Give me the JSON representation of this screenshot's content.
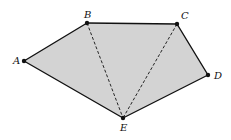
{
  "diagram": {
    "type": "pentagon",
    "fill_color": "#d3d3d3",
    "stroke_color": "#111111",
    "vertices": [
      {
        "id": "A",
        "label": "A",
        "x": 24,
        "y": 61,
        "lx": 13,
        "ly": 64
      },
      {
        "id": "B",
        "label": "B",
        "x": 87,
        "y": 23,
        "lx": 84,
        "ly": 18
      },
      {
        "id": "C",
        "label": "C",
        "x": 177,
        "y": 24,
        "lx": 181,
        "ly": 19
      },
      {
        "id": "D",
        "label": "D",
        "x": 208,
        "y": 75,
        "lx": 214,
        "ly": 79
      },
      {
        "id": "E",
        "label": "E",
        "x": 123,
        "y": 118,
        "lx": 120,
        "ly": 131
      }
    ],
    "edges": [
      [
        "A",
        "B"
      ],
      [
        "B",
        "C"
      ],
      [
        "C",
        "D"
      ],
      [
        "D",
        "E"
      ],
      [
        "E",
        "A"
      ]
    ],
    "diagonals": [
      [
        "B",
        "E"
      ],
      [
        "C",
        "E"
      ]
    ]
  }
}
